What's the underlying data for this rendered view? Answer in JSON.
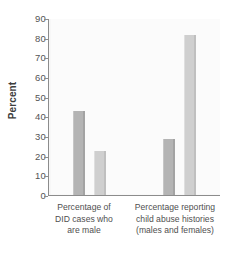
{
  "chart_data": {
    "type": "bar",
    "title": "",
    "xlabel": "",
    "ylabel": "Percent",
    "ylim": [
      0,
      90
    ],
    "ytick_step": 10,
    "yticks": [
      90,
      80,
      70,
      60,
      50,
      40,
      30,
      20,
      10,
      0
    ],
    "grid": false,
    "legend": false,
    "categories": [
      "Percentage of DID cases who are male",
      "Percentage reporting child abuse histories (males and females)"
    ],
    "category_lines": [
      [
        "Percentage of",
        "DID cases who",
        "are male"
      ],
      [
        "Percentage reporting",
        "child abuse histories",
        "(males and females)"
      ]
    ],
    "series": [
      {
        "name": "bar-1",
        "values": [
          43,
          29
        ],
        "color": "#b4b4b4"
      },
      {
        "name": "bar-2",
        "values": [
          23,
          82
        ],
        "color": "#cfcfcf"
      }
    ],
    "bars": [
      {
        "group": 0,
        "series": 0,
        "value": 43,
        "shade": "dark"
      },
      {
        "group": 0,
        "series": 1,
        "value": 23,
        "shade": "light"
      },
      {
        "group": 1,
        "series": 0,
        "value": 29,
        "shade": "dark"
      },
      {
        "group": 1,
        "series": 1,
        "value": 82,
        "shade": "light"
      }
    ]
  },
  "colors": {
    "background": "#ffffff",
    "plot_background": "#fbfbfb",
    "axis": "#8c8c8c",
    "text": "#4f4f4f",
    "bar_dark": "#b4b4b4",
    "bar_light": "#cfcfcf"
  }
}
